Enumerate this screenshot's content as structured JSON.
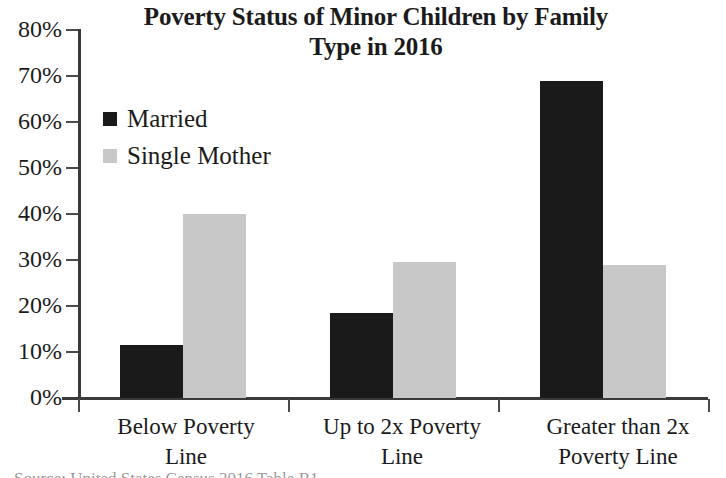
{
  "chart_data": {
    "type": "bar",
    "title": "Poverty Status of Minor Children by Family Type in 2016",
    "title_lines": [
      "Poverty Status of Minor Children by Family",
      "Type in 2016"
    ],
    "xlabel": "",
    "ylabel": "",
    "ylim": [
      0,
      80
    ],
    "y_tick_step": 10,
    "grid": false,
    "legend_position": "top-left",
    "categories": [
      "Below Poverty Line",
      "Up to 2x Poverty Line",
      "Greater than 2x Poverty Line"
    ],
    "category_lines": [
      [
        "Below Poverty",
        "Line"
      ],
      [
        "Up to 2x Poverty",
        "Line"
      ],
      [
        "Greater than 2x",
        "Poverty Line"
      ]
    ],
    "y_tick_labels": [
      "80%",
      "70%",
      "60%",
      "50%",
      "40%",
      "30%",
      "20%",
      "10%",
      "0%"
    ],
    "y_tick_values": [
      80,
      70,
      60,
      50,
      40,
      30,
      20,
      10,
      0
    ],
    "series": [
      {
        "name": "Married",
        "color": "#1a1a1a",
        "values": [
          11.5,
          18.5,
          69.0
        ]
      },
      {
        "name": "Single Mother",
        "color": "#c8c8c8",
        "values": [
          40.0,
          29.5,
          29.0
        ]
      }
    ],
    "value_unit": "%"
  },
  "legend": {
    "items": [
      {
        "label": "Married",
        "color": "#1a1a1a"
      },
      {
        "label": "Single Mother",
        "color": "#c8c8c8"
      }
    ]
  },
  "footer": {
    "source_sliver": "Source: United States Census 2016 Table B1"
  }
}
